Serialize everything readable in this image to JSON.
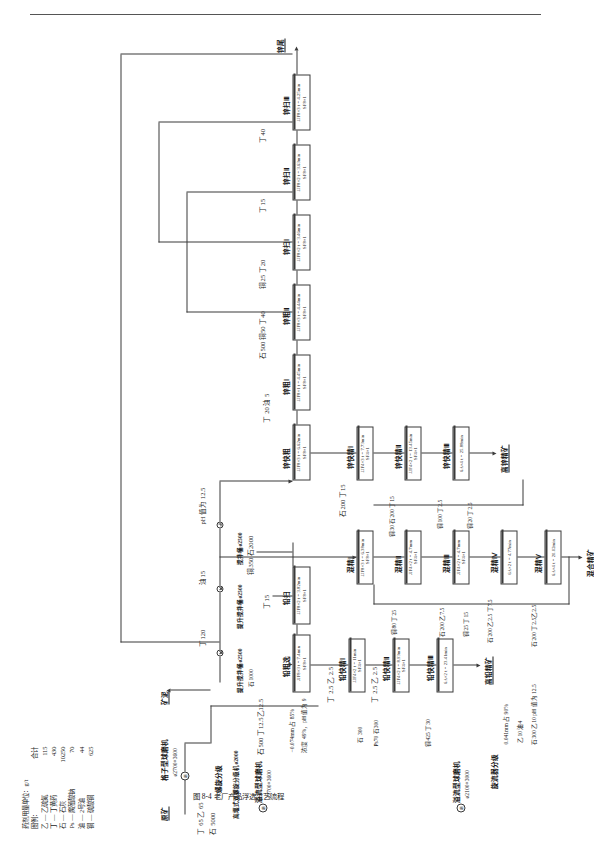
{
  "figure": {
    "caption": "图 8-4  老厂产品浮选工艺流程",
    "page_rule": true
  },
  "legend": {
    "dose_unit_title": "药剂用量单位：g/t",
    "legend_title": "图例：",
    "total_header": "合计",
    "items": [
      {
        "code": "乙",
        "name": "乙硫氮",
        "total": "115"
      },
      {
        "code": "丁",
        "name": "丁黄药",
        "total": "430"
      },
      {
        "code": "石",
        "name": "石灰",
        "total": "10250"
      },
      {
        "code": "Ps",
        "name": "腐殖酸钠",
        "total": "70"
      },
      {
        "code": "油",
        "name": "2号油",
        "total": "44"
      },
      {
        "code": "铜",
        "name": "硫酸铜",
        "total": "625"
      }
    ]
  },
  "streams": {
    "feed": "原矿",
    "slime": "矿泥",
    "pb_conc": "高铅精矿",
    "zn_conc": "高锌精矿",
    "bulk_conc": "混合精矿",
    "zn_tail": "锌尾"
  },
  "equipment": {
    "grate_mill": "格子型球磨机",
    "grate_mill_size": "ø2700×3600",
    "spiral_class": "螺旋分级",
    "hi_weir_spiral": "高堰式双螺旋分级机ø2000",
    "cyclone_class": "旋流器分级",
    "overflow_mill": "溢流型球磨机",
    "overflow_mill_size": "ø2700×3600",
    "overflow_mill2": "溢流型球磨机",
    "overflow_mill2_size": "ø2100×3000",
    "cyclone_class2": "旋流器分级",
    "lift_agitator_2500": "提升搅拌桶ø2500",
    "agitator_2500": "搅拌桶ø2500"
  },
  "reagents": {
    "r_feed_a": "丁 65  乙 65",
    "r_feed_b": "石 5000",
    "r_feed_c": "丁 65  乙 65",
    "r_feed_d": "石 5000",
    "r_mill2": "石500  丁12.5乙12.5",
    "r_mill2b": "石500  丁12.5乙12.5",
    "r_pbscav": "丁15",
    "r_pbscav2": "丁15",
    "r_cu_stone": "铜350  石2000",
    "r_t120": "丁120",
    "r_oil15": "油15",
    "r_ph125": "pH 值为 12.5",
    "r_stone1000": "石1000",
    "r_t20oil5": "丁 20 油 5",
    "r_st500cu50t40": "石500 铜50 丁40",
    "r_cu25t20": "铜25 丁20",
    "r_t15": "丁15",
    "r_t40": "丁40",
    "r_zn200t15": "石200 丁15",
    "r_cu30st200t15": "铜30 石200 丁15",
    "r_cu100t25": "铜100 丁2.5",
    "r_cu20t25": "铜20 丁2.5",
    "r_t25z25": "丁 2.5 乙 2.5",
    "r_t25z25b": "丁 2.5 乙 2.5",
    "r_pb70st300": "Ps70 石300",
    "r_st300": "石 300",
    "r_cu425t30": "铜425 丁30",
    "r_st300z10ph": "石300 乙10 pH 值为 12.5",
    "r_z10oil4": "乙10 油4",
    "r_cu80t25": "铜80 丁25",
    "r_st200z75": "石200 乙7.5",
    "r_cu25t15": "铜25 丁15",
    "r_st200z25t75": "石200 乙2.5 丁7.5",
    "r_st200t25z25": "石200 丁2.5乙2.5",
    "grind_fineness": "−0.074mm 占 85%",
    "density_ph": "浓度 49%，pH 值为 9",
    "fineness2": "0.041mm 占 90%"
  },
  "cells": [
    {
      "id": "pb-rough",
      "label": "铅粗选",
      "spec": "JJF8×3  t = 7.4min",
      "cfg": "SF8×1"
    },
    {
      "id": "pb-scav",
      "label": "铅扫",
      "spec": "JJF8×2  t = 3.82min",
      "cfg": "SF8×1"
    },
    {
      "id": "pb-clean1",
      "label": "铅快精Ⅰ",
      "spec": "JJF4×2  t = 11min",
      "cfg": "SF4×1"
    },
    {
      "id": "pb-clean2",
      "label": "铅快精Ⅱ",
      "spec": "JJF4×2  t = 8.93min",
      "cfg": "SF4×1"
    },
    {
      "id": "pb-clean3",
      "label": "铅快精Ⅲ",
      "spec": "6A×2  t = 23.41min",
      "cfg": ""
    },
    {
      "id": "zn-rough",
      "label": "锌快粗",
      "spec": "JJF8×3  t = 6.62min",
      "cfg": "SF8×1"
    },
    {
      "id": "zn-rgh1",
      "label": "锌粗Ⅰ",
      "spec": "JJF8×1  t = 4.45min",
      "cfg": "SF8×1"
    },
    {
      "id": "zn-rgh2",
      "label": "锌粗Ⅱ",
      "spec": "JJF8×3  t = 4.44min",
      "cfg": "SF8×1"
    },
    {
      "id": "zn-scav1",
      "label": "锌扫Ⅰ",
      "spec": "JJF8×2  t = 3.46min",
      "cfg": "SF8×1"
    },
    {
      "id": "zn-scav2",
      "label": "锌扫Ⅱ",
      "spec": "JJF8×2  t = 3.63min",
      "cfg": "SF8×1"
    },
    {
      "id": "zn-scav3",
      "label": "锌扫Ⅲ",
      "spec": "JJF8×3  t = 4.25min",
      "cfg": "SF8×1"
    },
    {
      "id": "zn-cl1",
      "label": "锌快精Ⅰ",
      "spec": "JJF4×3  t = 7.73min",
      "cfg": "SF4×1"
    },
    {
      "id": "zn-cl2",
      "label": "锌快精Ⅱ",
      "spec": "JJF4×2  t = 13.45min",
      "cfg": "SF4×1"
    },
    {
      "id": "zn-cl3",
      "label": "锌快精Ⅲ",
      "spec": "6A×4  t = 25.88min",
      "cfg": ""
    },
    {
      "id": "mix1",
      "label": "混精Ⅰ",
      "spec": "JJF8×3  t = 6.38min",
      "cfg": "SF8×1"
    },
    {
      "id": "mix2",
      "label": "混精Ⅱ",
      "spec": "JJF4×2  t = 4.7mm",
      "cfg": "SF4×1"
    },
    {
      "id": "mix3",
      "label": "混精Ⅲ",
      "spec": "JJF4×2  t = 4.7mm",
      "cfg": "SF4×1"
    },
    {
      "id": "mix4",
      "label": "混精Ⅳ",
      "spec": "6A×2  t = 4.77min",
      "cfg": ""
    },
    {
      "id": "mix5",
      "label": "混精Ⅴ",
      "spec": "6A×4  t = 20.02min",
      "cfg": ""
    }
  ]
}
